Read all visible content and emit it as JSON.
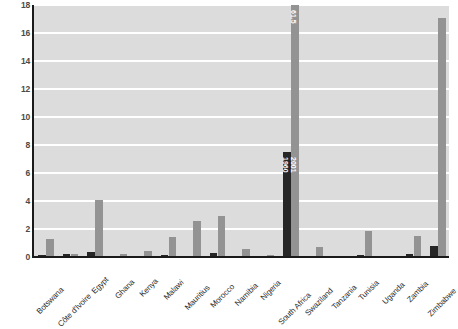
{
  "chart_data": {
    "type": "bar",
    "title": "",
    "subtitle": "",
    "xlabel": "",
    "ylabel": "",
    "ylim": [
      0,
      18
    ],
    "yticks": [
      0,
      2,
      4,
      6,
      8,
      10,
      12,
      14,
      16,
      18
    ],
    "grid": true,
    "legend_position": "inline-bar-labels",
    "categories": [
      "Botswana",
      "Côte d'Ivoire",
      "Egypt",
      "Ghana",
      "Kenya",
      "Malawi",
      "Mauritius",
      "Morocco",
      "Namibia",
      "Nigeria",
      "South Africa",
      "Swaziland",
      "Tanzania",
      "Tunisia",
      "Uganda",
      "Zambia",
      "Zimbabwe"
    ],
    "series": [
      {
        "name": "1960",
        "color": "#262626",
        "values": [
          0.15,
          0.2,
          0.35,
          0.05,
          0.08,
          0.12,
          0.1,
          0.3,
          0.05,
          0.08,
          7.5,
          0.04,
          0.05,
          0.12,
          0.05,
          0.2,
          0.8
        ]
      },
      {
        "name": "2001",
        "color": "#939393",
        "values": [
          1.3,
          0.25,
          4.1,
          0.25,
          0.4,
          1.4,
          2.6,
          2.9,
          0.55,
          0.12,
          61.5,
          0.75,
          0.1,
          1.85,
          0.07,
          1.5,
          17.1
        ]
      }
    ],
    "annotations": [
      {
        "category": "South Africa",
        "series": "2001",
        "text": "61.5",
        "note": "bar truncated by axis maximum"
      },
      {
        "category": "South Africa",
        "series": "1960",
        "text": "1960"
      },
      {
        "category": "South Africa",
        "series": "2001",
        "text": "2001"
      }
    ],
    "series_inline_labels": {
      "dark_bar_label": "1960",
      "gray_bar_label": "2001",
      "tall_bar_value": "61.5"
    }
  }
}
